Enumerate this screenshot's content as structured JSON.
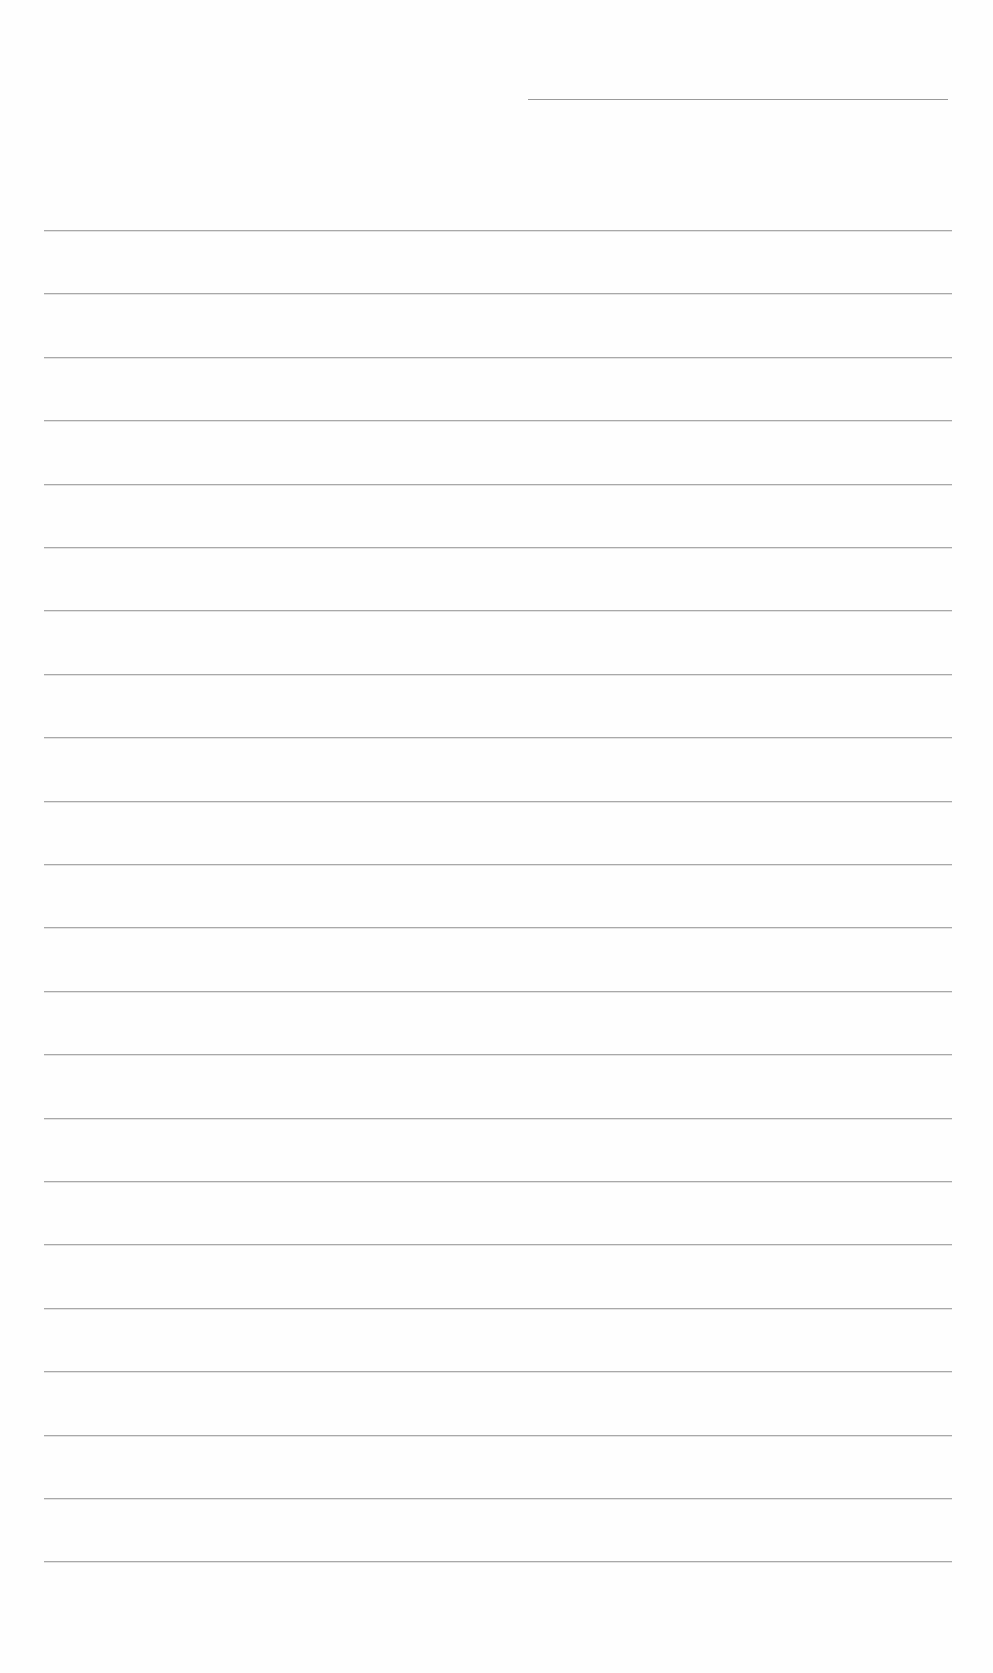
{
  "page": {
    "type": "blank ruled sheet",
    "background_color": "#fefefe",
    "line_color": "#a8a8a8"
  },
  "header_line": {
    "left": 528,
    "top": 99,
    "width": 420
  },
  "ruled_lines": {
    "count": 22,
    "left": 44,
    "width": 908,
    "first_top": 230,
    "spacing": 63.4
  }
}
